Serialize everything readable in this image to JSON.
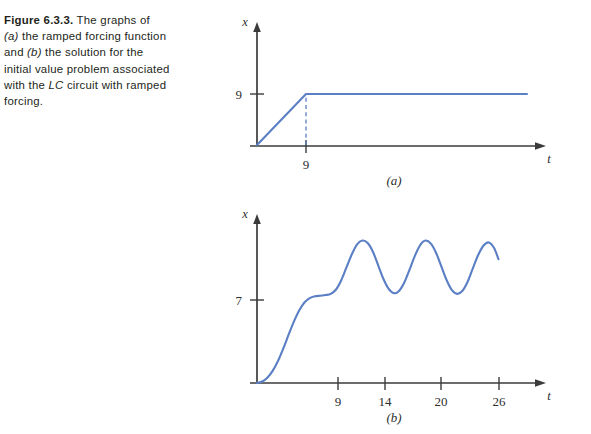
{
  "caption": {
    "label": "Figure 6.3.3.",
    "line1_rest": " The graphs of",
    "line2_a": "(a)",
    "line2_rest": " the ramped forcing function",
    "line3_and": "and ",
    "line3_b": "(b)",
    "line3_rest": " the solution for the",
    "line4": "initial value problem associated",
    "line5_pre": "with the ",
    "line5_lc": "LC",
    "line5_rest": " circuit with ramped",
    "line6": "forcing."
  },
  "colors": {
    "curve": "#5b7fc4",
    "axis": "#3b3b3b",
    "text": "#231f20"
  },
  "chart_data": [
    {
      "type": "line",
      "id": "panel-a",
      "title": "(a)",
      "xlabel": "t",
      "ylabel": "x",
      "grid": false,
      "legend": null,
      "xticks": [
        9
      ],
      "xticklabels": [
        "9"
      ],
      "yticks": [
        9
      ],
      "yticklabels": [
        "9"
      ],
      "xlim": [
        0,
        50
      ],
      "ylim": [
        0,
        13
      ],
      "description": "Ramped forcing function: linear ramp from (0,0) to (9,9), then constant at 9.",
      "series": [
        {
          "name": "ramped forcing",
          "x": [
            0,
            9,
            47
          ],
          "y": [
            0,
            9,
            9
          ]
        }
      ],
      "annotations": [
        {
          "name": "dashed-drop-line",
          "type": "dashed-vertical",
          "x": 9,
          "y0": 0,
          "y1": 9
        }
      ]
    },
    {
      "type": "line",
      "id": "panel-b",
      "title": "(b)",
      "xlabel": "t",
      "ylabel": "x",
      "grid": false,
      "legend": null,
      "xticks": [
        9,
        14,
        20,
        26
      ],
      "xticklabels": [
        "9",
        "14",
        "20",
        "26"
      ],
      "yticks": [
        7
      ],
      "yticklabels": [
        "7"
      ],
      "xlim": [
        0,
        32
      ],
      "ylim": [
        0,
        13
      ],
      "description": "Solution of the LC circuit IVP with ramped forcing: smooth S-shaped rise to a shelf near x = 7 for t < 9, then sustained sinusoidal oscillation about a mean of about 9.3 with amplitude about 2.2 and period about 6.3, ending near t = 27.5.",
      "series": [
        {
          "name": "solution x(t)",
          "x": [
            0,
            0.6,
            1.2,
            1.8,
            2.4,
            3.0,
            3.6,
            4.2,
            4.8,
            5.4,
            6.0,
            6.6,
            7.2,
            7.8,
            8.4,
            9.0,
            9.6,
            10.2,
            10.8,
            11.4,
            12.0,
            12.6,
            13.2,
            13.8,
            14.4,
            15.0,
            15.6,
            16.2,
            16.8,
            17.4,
            18.0,
            18.6,
            19.2,
            19.8,
            20.4,
            21.0,
            21.6,
            22.2,
            22.8,
            23.4,
            24.0,
            24.6,
            25.2,
            25.8,
            26.4,
            27.0,
            27.5
          ],
          "y": [
            0.0,
            0.12,
            0.45,
            1.0,
            1.8,
            2.8,
            3.9,
            4.95,
            5.85,
            6.5,
            6.85,
            7.0,
            7.05,
            7.1,
            7.2,
            7.55,
            8.3,
            9.35,
            10.4,
            11.2,
            11.5,
            11.3,
            10.6,
            9.5,
            8.4,
            7.6,
            7.25,
            7.45,
            8.15,
            9.2,
            10.3,
            11.15,
            11.5,
            11.25,
            10.5,
            9.4,
            8.3,
            7.5,
            7.2,
            7.45,
            8.2,
            9.3,
            10.35,
            11.1,
            11.35,
            10.9,
            10.0
          ]
        }
      ]
    }
  ]
}
